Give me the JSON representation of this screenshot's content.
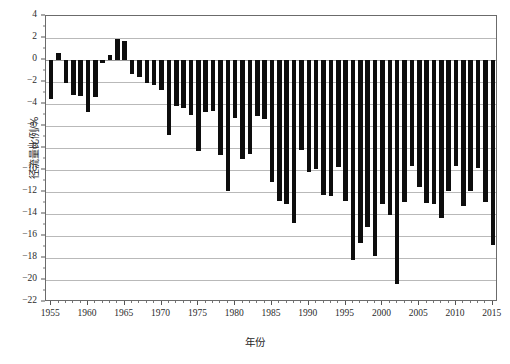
{
  "chart_data": {
    "type": "bar",
    "title": "",
    "xlabel": "年份",
    "ylabel": "径流量比例/%",
    "xlim": [
      1954.3,
      2015.7
    ],
    "ylim": [
      -22,
      4
    ],
    "grid": true,
    "legend_position": "none",
    "bar_color": "#0d0d0d",
    "ytick_labels": [
      "4",
      "2",
      "0",
      "-2",
      "-4",
      "-6",
      "-8",
      "-10",
      "-12",
      "-14",
      "-16",
      "-18",
      "-20",
      "-22"
    ],
    "ytick_values": [
      4,
      2,
      0,
      -2,
      -4,
      -6,
      -8,
      -10,
      -12,
      -14,
      -16,
      -18,
      -20,
      -22
    ],
    "xtick_labels": [
      "1955",
      "1960",
      "1965",
      "1970",
      "1975",
      "1980",
      "1985",
      "1990",
      "1995",
      "2000",
      "2005",
      "2010",
      "2015"
    ],
    "xtick_values": [
      1955,
      1960,
      1965,
      1970,
      1975,
      1980,
      1985,
      1990,
      1995,
      2000,
      2005,
      2010,
      2015
    ],
    "categories": [
      1955,
      1956,
      1957,
      1958,
      1959,
      1960,
      1961,
      1962,
      1963,
      1964,
      1965,
      1966,
      1967,
      1968,
      1969,
      1970,
      1971,
      1972,
      1973,
      1974,
      1975,
      1976,
      1977,
      1978,
      1979,
      1980,
      1981,
      1982,
      1983,
      1984,
      1985,
      1986,
      1987,
      1988,
      1989,
      1990,
      1991,
      1992,
      1993,
      1994,
      1995,
      1996,
      1997,
      1998,
      1999,
      2000,
      2001,
      2002,
      2003,
      2004,
      2005,
      2006,
      2007,
      2008,
      2009,
      2010,
      2011,
      2012,
      2013,
      2014,
      2015
    ],
    "values": [
      -3.5,
      0.6,
      -2.1,
      -3.2,
      -3.3,
      -4.7,
      -3.4,
      -0.3,
      0.5,
      1.9,
      1.7,
      -1.3,
      -1.5,
      -2.1,
      -2.3,
      -2.7,
      -6.8,
      -4.2,
      -4.4,
      -5.0,
      -8.3,
      -4.7,
      -4.6,
      -8.6,
      -11.9,
      -5.3,
      -9.0,
      -8.5,
      -5.1,
      -5.4,
      -11.1,
      -12.8,
      -13.1,
      -14.8,
      -8.2,
      -10.2,
      -9.9,
      -12.3,
      -12.4,
      -9.7,
      -12.8,
      -18.2,
      -16.6,
      -15.2,
      -17.8,
      -13.1,
      -14.1,
      -20.4,
      -12.9,
      -9.6,
      -11.5,
      -13.0,
      -13.1,
      -14.4,
      -11.9,
      -9.6,
      -13.3,
      -11.9,
      -9.8,
      -12.9,
      -16.8
    ],
    "series": [
      {
        "name": "径流量比例",
        "values": [
          -3.5,
          0.6,
          -2.1,
          -3.2,
          -3.3,
          -4.7,
          -3.4,
          -0.3,
          0.5,
          1.9,
          1.7,
          -1.3,
          -1.5,
          -2.1,
          -2.3,
          -2.7,
          -6.8,
          -4.2,
          -4.4,
          -5.0,
          -8.3,
          -4.7,
          -4.6,
          -8.6,
          -11.9,
          -5.3,
          -9.0,
          -8.5,
          -5.1,
          -5.4,
          -11.1,
          -12.8,
          -13.1,
          -14.8,
          -8.2,
          -10.2,
          -9.9,
          -12.3,
          -12.4,
          -9.7,
          -12.8,
          -18.2,
          -16.6,
          -15.2,
          -17.8,
          -13.1,
          -14.1,
          -20.4,
          -12.9,
          -9.6,
          -11.5,
          -13.0,
          -13.1,
          -14.4,
          -11.9,
          -9.6,
          -13.3,
          -11.9,
          -9.8,
          -12.9,
          -16.8
        ]
      }
    ]
  }
}
